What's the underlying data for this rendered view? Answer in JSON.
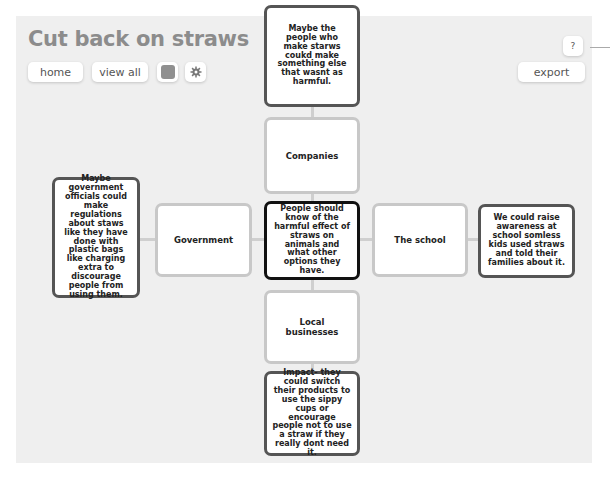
{
  "header": {
    "title": "Cut back on straws"
  },
  "toolbar": {
    "home_label": "home",
    "view_all_label": "view all",
    "color_swatch": "#8f8f8f",
    "settings_icon": "gear-icon",
    "help_label": "?",
    "export_label": "export"
  },
  "map": {
    "center": {
      "text": "People should know of the harmful effect of straws on animals and what other options they have."
    },
    "categories": {
      "top": "Companies",
      "left": "Government",
      "right": "The school",
      "bottom": "Local businesses"
    },
    "ideas": {
      "top": "Maybe the people who make starws coukd make something else that wasnt as harmful.",
      "left": "Maybe government officials could make regulations about staws like they have done with plastic bags like charging extra to discourage people from using them.",
      "right": "We could raise awareness at school somless kids used straws and told their families about it.",
      "bottom": "Impact- they could switch their products to use the sippy cups or encourage people not to use a straw if they really dont need it."
    }
  },
  "colors": {
    "background": "#efefef",
    "title": "#8c8c8c",
    "category_border": "#c8c8c8",
    "idea_border": "#555555",
    "center_border": "#111111"
  }
}
